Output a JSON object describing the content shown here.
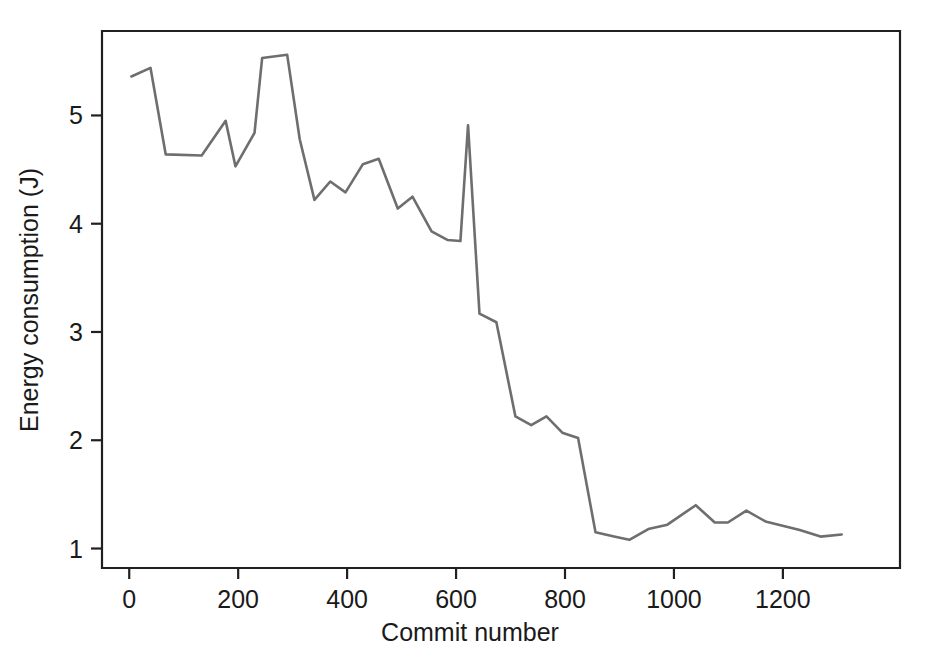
{
  "figure": {
    "background_color": "#ffffff",
    "frame_color": "#231f20",
    "line_color": "#6e6e6e"
  },
  "axis": {
    "x_title": "Commit number",
    "y_title": "Energy consumption (J)",
    "x_ticks": [
      "0",
      "200",
      "400",
      "600",
      "800",
      "1000",
      "1200"
    ],
    "y_ticks": [
      "1",
      "2",
      "3",
      "4",
      "5"
    ]
  },
  "chart_data": {
    "type": "line",
    "title": "",
    "xlabel": "Commit number",
    "ylabel": "Energy consumption (J)",
    "xlim": [
      -50,
      1415
    ],
    "ylim": [
      0.82,
      5.78
    ],
    "xticks": [
      0,
      200,
      400,
      600,
      800,
      1000,
      1200
    ],
    "yticks": [
      1,
      2,
      3,
      4,
      5
    ],
    "grid": false,
    "legend": false,
    "series": [
      {
        "name": "Energy consumption",
        "color": "#6e6e6e",
        "x": [
          4,
          39,
          67,
          133,
          177,
          195,
          230,
          244,
          290,
          313,
          340,
          369,
          397,
          429,
          458,
          493,
          520,
          555,
          584,
          608,
          622,
          643,
          674,
          709,
          738,
          766,
          795,
          824,
          856,
          890,
          918,
          953,
          988,
          1040,
          1075,
          1099,
          1133,
          1168,
          1231,
          1269,
          1308
        ],
        "y": [
          5.36,
          5.44,
          4.64,
          4.63,
          4.95,
          4.53,
          4.84,
          5.53,
          5.56,
          4.78,
          4.22,
          4.39,
          4.29,
          4.55,
          4.6,
          4.14,
          4.25,
          3.93,
          3.85,
          3.84,
          4.91,
          3.17,
          3.09,
          2.22,
          2.14,
          2.22,
          2.07,
          2.02,
          1.15,
          1.11,
          1.08,
          1.18,
          1.22,
          1.4,
          1.24,
          1.24,
          1.35,
          1.25,
          1.17,
          1.11,
          1.13
        ]
      }
    ]
  }
}
